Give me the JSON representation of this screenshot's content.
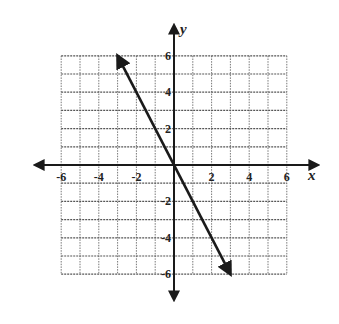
{
  "chart_data": {
    "type": "line",
    "title": "",
    "xlabel": "x",
    "ylabel": "y",
    "xlim": [
      -6,
      6
    ],
    "ylim": [
      -6,
      6
    ],
    "grid": true,
    "grid_step": 1,
    "x_ticks": [
      -6,
      -4,
      -2,
      2,
      4,
      6
    ],
    "y_ticks": [
      6,
      4,
      2,
      -2,
      -4,
      -6
    ],
    "x_tick_labels": [
      "-6",
      "-4",
      "-2",
      "2",
      "4",
      "6"
    ],
    "y_tick_labels": [
      "6",
      "4",
      "2",
      "-2",
      "-4",
      "-6"
    ],
    "series": [
      {
        "name": "line",
        "equation": "y = -2x",
        "x": [
          -3,
          0,
          3
        ],
        "y": [
          6,
          0,
          -6
        ],
        "arrows": "both"
      }
    ]
  },
  "colors": {
    "line": "#1a1a1a",
    "grid": "#555555",
    "axis": "#1a1a1a"
  }
}
